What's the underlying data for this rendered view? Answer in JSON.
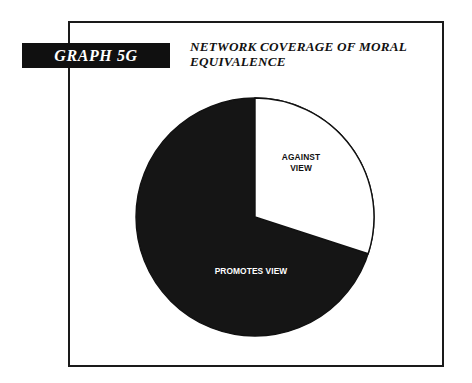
{
  "figure": {
    "tag": "GRAPH 5G",
    "title_line1": "NETWORK COVERAGE OF MORAL",
    "title_line2": "EQUIVALENCE",
    "frame_color": "#1a1a1a",
    "tag_background": "#101010",
    "tag_text_color": "#ffffff"
  },
  "chart_data": {
    "type": "pie",
    "title": "NETWORK COVERAGE OF MORAL EQUIVALENCE",
    "xlabel": "",
    "ylabel": "",
    "legend": "none",
    "grid": false,
    "start_angle_deg": 0,
    "direction": "clockwise",
    "categories": [
      "AGAINST VIEW",
      "PROMOTES VIEW"
    ],
    "values": [
      30,
      70
    ],
    "slices": [
      {
        "label": "AGAINST VIEW",
        "label_line1": "AGAINST",
        "label_line2": "VIEW",
        "value": 30,
        "angle_deg": 108,
        "fill": "#ffffff",
        "stroke": "#111111",
        "text_color": "#111111"
      },
      {
        "label": "PROMOTES VIEW",
        "label_line1": "PROMOTES VIEW",
        "label_line2": "",
        "value": 70,
        "angle_deg": 252,
        "fill": "#151515",
        "stroke": "#111111",
        "text_color": "#ffffff"
      }
    ]
  }
}
